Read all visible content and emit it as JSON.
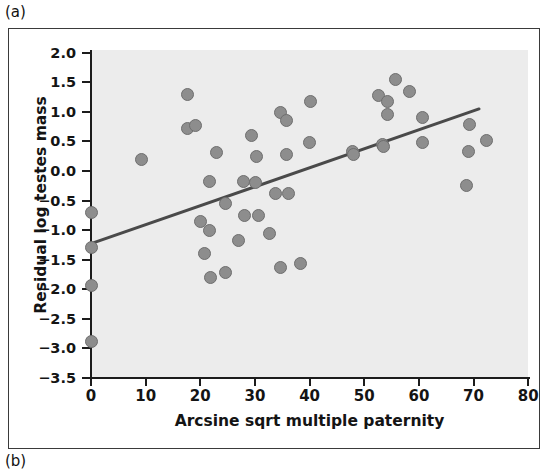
{
  "panels": {
    "a_label": "(a)",
    "b_label": "(b)"
  },
  "chart_data": {
    "type": "scatter",
    "title": "",
    "xlabel": "Arcsine sqrt multiple paternity",
    "ylabel": "Residual log testes mass",
    "xlim": [
      0,
      80
    ],
    "ylim": [
      -3.5,
      2.0
    ],
    "xticks": [
      0,
      10,
      20,
      30,
      40,
      50,
      60,
      70,
      80
    ],
    "xtick_labels": [
      "0",
      "10",
      "20",
      "30",
      "40",
      "50",
      "60",
      "70",
      "80"
    ],
    "yticks": [
      2.0,
      1.5,
      1.0,
      0.5,
      0.0,
      -0.5,
      -1.0,
      -1.5,
      -2.0,
      -2.5,
      -3.0,
      -3.5
    ],
    "ytick_labels": [
      "2.0",
      "1.5",
      "1.0",
      "0.5",
      "0.0",
      "-0.5",
      "-1.0",
      "-1.5",
      "-2.0",
      "-2.5",
      "-3.0",
      "-3.5"
    ],
    "grid": false,
    "legend": false,
    "plot_background": "#ececec",
    "marker_fill": "#8d8d8d",
    "marker_edge": "#6e6e6e",
    "marker_size_px": 13,
    "line_color": "#4a4a4a",
    "points": [
      {
        "x": 0.0,
        "y": -0.7
      },
      {
        "x": 0.0,
        "y": -1.3
      },
      {
        "x": 0.0,
        "y": -1.93
      },
      {
        "x": 0.0,
        "y": -2.89
      },
      {
        "x": 9.3,
        "y": 0.19
      },
      {
        "x": 17.7,
        "y": 1.29
      },
      {
        "x": 17.6,
        "y": 0.72
      },
      {
        "x": 19.2,
        "y": 0.77
      },
      {
        "x": 20.0,
        "y": -0.86
      },
      {
        "x": 20.8,
        "y": -1.4
      },
      {
        "x": 21.7,
        "y": -1.0
      },
      {
        "x": 21.6,
        "y": -0.18
      },
      {
        "x": 22.9,
        "y": 0.31
      },
      {
        "x": 21.9,
        "y": -1.8
      },
      {
        "x": 24.6,
        "y": -1.71
      },
      {
        "x": 24.6,
        "y": -0.55
      },
      {
        "x": 27.0,
        "y": -1.17
      },
      {
        "x": 27.9,
        "y": -0.18
      },
      {
        "x": 28.0,
        "y": -0.76
      },
      {
        "x": 29.3,
        "y": 0.6
      },
      {
        "x": 30.1,
        "y": -0.19
      },
      {
        "x": 30.3,
        "y": 0.24
      },
      {
        "x": 30.6,
        "y": -0.76
      },
      {
        "x": 32.6,
        "y": -1.05
      },
      {
        "x": 33.7,
        "y": -0.38
      },
      {
        "x": 34.6,
        "y": 0.99
      },
      {
        "x": 34.6,
        "y": -1.64
      },
      {
        "x": 35.7,
        "y": 0.85
      },
      {
        "x": 35.8,
        "y": 0.28
      },
      {
        "x": 36.2,
        "y": -0.38
      },
      {
        "x": 38.3,
        "y": -1.56
      },
      {
        "x": 40.0,
        "y": 0.49
      },
      {
        "x": 40.2,
        "y": 1.18
      },
      {
        "x": 47.9,
        "y": 0.33
      },
      {
        "x": 48.1,
        "y": 0.28
      },
      {
        "x": 52.6,
        "y": 1.27
      },
      {
        "x": 53.3,
        "y": 0.45
      },
      {
        "x": 53.6,
        "y": 0.42
      },
      {
        "x": 54.3,
        "y": 1.18
      },
      {
        "x": 54.3,
        "y": 0.95
      },
      {
        "x": 55.7,
        "y": 1.55
      },
      {
        "x": 58.3,
        "y": 1.34
      },
      {
        "x": 60.6,
        "y": 0.9
      },
      {
        "x": 60.6,
        "y": 0.48
      },
      {
        "x": 68.8,
        "y": -0.24
      },
      {
        "x": 69.1,
        "y": 0.33
      },
      {
        "x": 69.3,
        "y": 0.78
      },
      {
        "x": 72.3,
        "y": 0.52
      }
    ],
    "trend_line": {
      "x_start": 0.0,
      "y_start": -1.23,
      "x_end": 71.0,
      "y_end": 1.05
    }
  }
}
